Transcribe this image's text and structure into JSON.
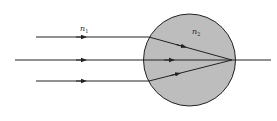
{
  "diagram": {
    "title": "",
    "labels": {
      "outer_medium": {
        "base": "n",
        "sub": "1"
      },
      "sphere_medium": {
        "base": "n",
        "sub": "2"
      }
    },
    "colors": {
      "background": "#ffffff",
      "sphere_fill": "#bdbdbd",
      "line": "#222222"
    },
    "sphere": {
      "cx": 189.5,
      "cy": 60,
      "r": 46
    },
    "focus_point": {
      "x": 232,
      "y": 60
    },
    "rays": [
      {
        "name": "upper-ray",
        "start_x": 36,
        "y": 37,
        "entry_x": 149
      },
      {
        "name": "axial-ray",
        "start_x": 15,
        "y": 60,
        "entry_x": 144
      },
      {
        "name": "lower-ray",
        "start_x": 36,
        "y": 81,
        "entry_x": 149
      }
    ],
    "axis_end_x": 271
  }
}
